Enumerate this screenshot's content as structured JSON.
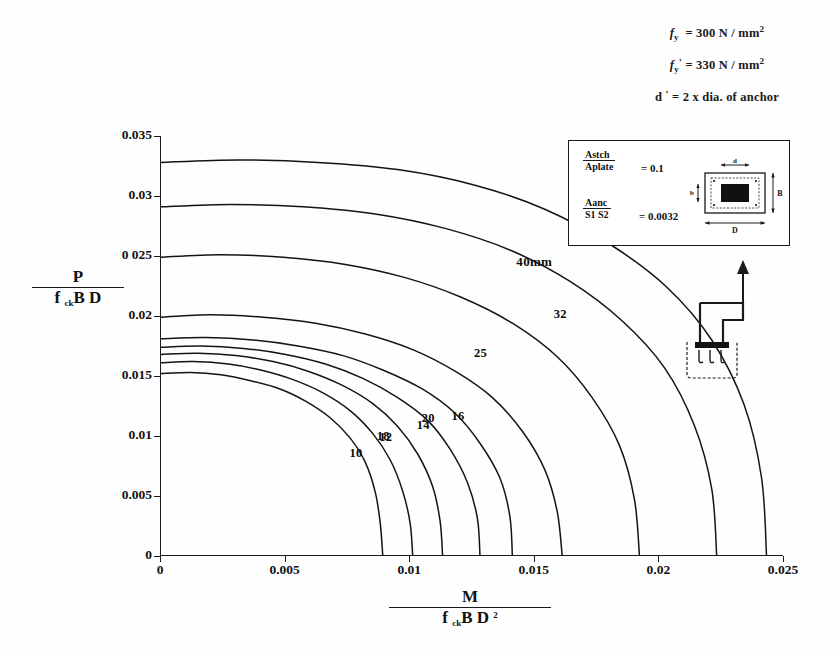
{
  "figure": {
    "domain": "chart",
    "header_notes": [
      {
        "symbol": "f",
        "sub": "y",
        "prime": "",
        "text": "= 300 N / mm",
        "sup": "2"
      },
      {
        "symbol": "f",
        "sub": "y",
        "prime": "'",
        "text": "= 330 N / mm",
        "sup": "2"
      },
      {
        "symbol": "d",
        "sub": "",
        "prime": "'",
        "text": "= 2 x dia. of anchor",
        "sup": ""
      }
    ],
    "header_notes_plain": [
      "f y = 300 N / mm2",
      "f y ' = 330 N / mm2",
      "d ' = 2 x dia. of anchor"
    ]
  },
  "inset": {
    "ratios": [
      {
        "numerator": "Astch",
        "denominator": "Aplate",
        "equals": "= 0.1"
      },
      {
        "numerator": "Aanc",
        "denominator": "S1 S2",
        "equals": "= 0.0032"
      }
    ],
    "plate_labels": {
      "top": "d",
      "left": "b",
      "right": "B",
      "bottom": "D"
    }
  },
  "chart_data": {
    "type": "line",
    "title": "",
    "xlabel_numerator": "M",
    "xlabel_denominator": "f ck B D 2",
    "ylabel_numerator": "P",
    "ylabel_denominator": "f ck B D",
    "xlim": [
      0,
      0.025
    ],
    "ylim": [
      0,
      0.035
    ],
    "xticks": [
      0,
      0.005,
      0.01,
      0.015,
      0.02,
      0.025
    ],
    "xticklabels": [
      "0",
      "0.005",
      "0.01",
      "0.015",
      "0.02",
      "0.025"
    ],
    "yticks": [
      0,
      0.005,
      0.01,
      0.015,
      0.02,
      0.025,
      0.03,
      0.035
    ],
    "yticklabels": [
      "0",
      "0.005",
      "0.01",
      "0.015",
      "0.02",
      "0 025",
      "0.03",
      "0.035"
    ],
    "grid": false,
    "legend_position": "inline-curve-labels",
    "series": [
      {
        "name": "10",
        "label": "10",
        "label_xy": [
          0.0076,
          0.0085
        ],
        "points": [
          [
            0,
            0.0152
          ],
          [
            0.0012,
            0.0153
          ],
          [
            0.0024,
            0.0151
          ],
          [
            0.0036,
            0.0146
          ],
          [
            0.0048,
            0.0139
          ],
          [
            0.0058,
            0.0129
          ],
          [
            0.0068,
            0.0115
          ],
          [
            0.0076,
            0.0098
          ],
          [
            0.0082,
            0.0078
          ],
          [
            0.0086,
            0.0053
          ],
          [
            0.0088,
            0.0027
          ],
          [
            0.0089,
            0
          ]
        ]
      },
      {
        "name": "12",
        "label": "12",
        "label_xy": [
          0.0088,
          0.0098
        ],
        "points": [
          [
            0,
            0.0161
          ],
          [
            0.0013,
            0.0162
          ],
          [
            0.0027,
            0.016
          ],
          [
            0.004,
            0.0155
          ],
          [
            0.0053,
            0.0147
          ],
          [
            0.0065,
            0.0136
          ],
          [
            0.0076,
            0.0121
          ],
          [
            0.0085,
            0.0102
          ],
          [
            0.0092,
            0.008
          ],
          [
            0.0097,
            0.0054
          ],
          [
            0.01,
            0.0027
          ],
          [
            0.0101,
            0
          ]
        ]
      },
      {
        "name": "14",
        "label": "14",
        "label_xy": [
          0.0103,
          0.0108
        ],
        "points": [
          [
            0,
            0.0168
          ],
          [
            0.0015,
            0.0169
          ],
          [
            0.003,
            0.0167
          ],
          [
            0.0045,
            0.0162
          ],
          [
            0.0059,
            0.0154
          ],
          [
            0.0073,
            0.0142
          ],
          [
            0.0085,
            0.0127
          ],
          [
            0.0095,
            0.0108
          ],
          [
            0.0103,
            0.0085
          ],
          [
            0.0109,
            0.0058
          ],
          [
            0.0112,
            0.0029
          ],
          [
            0.0113,
            0
          ]
        ]
      },
      {
        "name": "16",
        "label": "16",
        "label_xy": [
          0.0117,
          0.0116
        ],
        "points": [
          [
            0,
            0.0174
          ],
          [
            0.0016,
            0.0175
          ],
          [
            0.0033,
            0.0173
          ],
          [
            0.005,
            0.0168
          ],
          [
            0.0066,
            0.016
          ],
          [
            0.0081,
            0.0148
          ],
          [
            0.0095,
            0.0132
          ],
          [
            0.0107,
            0.0113
          ],
          [
            0.0116,
            0.0089
          ],
          [
            0.0123,
            0.0061
          ],
          [
            0.0127,
            0.0031
          ],
          [
            0.0128,
            0
          ]
        ]
      },
      {
        "name": "18",
        "label": "18",
        "label_xy": [
          0.0087,
          0.0099
        ],
        "points": [
          [
            0,
            0.0181
          ],
          [
            0.0018,
            0.0182
          ],
          [
            0.0037,
            0.018
          ],
          [
            0.0055,
            0.0175
          ],
          [
            0.0073,
            0.0167
          ],
          [
            0.0089,
            0.0155
          ],
          [
            0.0105,
            0.0139
          ],
          [
            0.0118,
            0.0119
          ],
          [
            0.0128,
            0.0094
          ],
          [
            0.0136,
            0.0065
          ],
          [
            0.014,
            0.0033
          ],
          [
            0.0141,
            0
          ]
        ]
      },
      {
        "name": "20",
        "label": "20",
        "label_xy": [
          0.0105,
          0.0114
        ],
        "points": [
          [
            0,
            0.0199
          ],
          [
            0.002,
            0.0201
          ],
          [
            0.0041,
            0.0199
          ],
          [
            0.0062,
            0.0194
          ],
          [
            0.0082,
            0.0185
          ],
          [
            0.0101,
            0.0172
          ],
          [
            0.0118,
            0.0154
          ],
          [
            0.0133,
            0.0132
          ],
          [
            0.0145,
            0.0104
          ],
          [
            0.0154,
            0.0072
          ],
          [
            0.0159,
            0.0037
          ],
          [
            0.0161,
            0
          ]
        ]
      },
      {
        "name": "25",
        "label": "25",
        "label_xy": [
          0.0126,
          0.0168
        ],
        "points": [
          [
            0,
            0.0249
          ],
          [
            0.0024,
            0.0251
          ],
          [
            0.0049,
            0.0249
          ],
          [
            0.0074,
            0.0243
          ],
          [
            0.0098,
            0.0232
          ],
          [
            0.012,
            0.0216
          ],
          [
            0.0141,
            0.0194
          ],
          [
            0.0159,
            0.0166
          ],
          [
            0.0173,
            0.0132
          ],
          [
            0.0184,
            0.0092
          ],
          [
            0.019,
            0.0047
          ],
          [
            0.0192,
            0
          ]
        ]
      },
      {
        "name": "32",
        "label": "32",
        "label_xy": [
          0.0158,
          0.0201
        ],
        "points": [
          [
            0,
            0.0291
          ],
          [
            0.0028,
            0.0293
          ],
          [
            0.0057,
            0.0291
          ],
          [
            0.0086,
            0.0285
          ],
          [
            0.0114,
            0.0273
          ],
          [
            0.014,
            0.0255
          ],
          [
            0.0164,
            0.0229
          ],
          [
            0.0185,
            0.0196
          ],
          [
            0.0202,
            0.0157
          ],
          [
            0.0214,
            0.0109
          ],
          [
            0.0221,
            0.0056
          ],
          [
            0.0223,
            0
          ]
        ]
      },
      {
        "name": "40mm",
        "label": "40mm",
        "label_xy": [
          0.0143,
          0.0245
        ],
        "points": [
          [
            0,
            0.0328
          ],
          [
            0.0031,
            0.033
          ],
          [
            0.0063,
            0.0328
          ],
          [
            0.0095,
            0.0322
          ],
          [
            0.0126,
            0.0309
          ],
          [
            0.0154,
            0.0289
          ],
          [
            0.018,
            0.026
          ],
          [
            0.0203,
            0.0224
          ],
          [
            0.0221,
            0.018
          ],
          [
            0.0234,
            0.0126
          ],
          [
            0.0241,
            0.0065
          ],
          [
            0.0243,
            0
          ]
        ]
      }
    ]
  }
}
